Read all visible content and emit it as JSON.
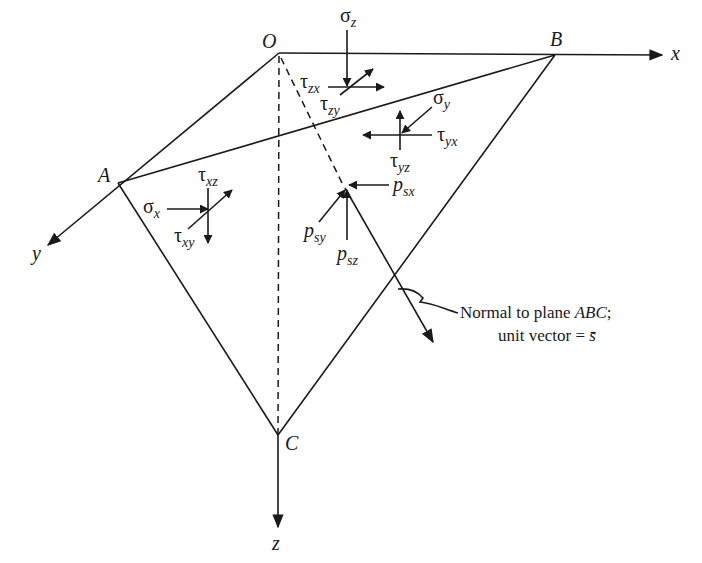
{
  "diagram": {
    "type": "stress tetrahedron",
    "points": {
      "O": {
        "label": "O"
      },
      "A": {
        "label": "A"
      },
      "B": {
        "label": "B"
      },
      "C": {
        "label": "C"
      }
    },
    "axes": {
      "x": "x",
      "y": "y",
      "z": "z"
    },
    "stresses": {
      "sigma_z": {
        "sym": "σ",
        "sub": "z"
      },
      "tau_zx": {
        "sym": "τ",
        "sub": "zx"
      },
      "tau_zy": {
        "sym": "τ",
        "sub": "zy"
      },
      "sigma_y": {
        "sym": "σ",
        "sub": "y"
      },
      "tau_yx": {
        "sym": "τ",
        "sub": "yx"
      },
      "tau_yz": {
        "sym": "τ",
        "sub": "yz"
      },
      "sigma_x": {
        "sym": "σ",
        "sub": "x"
      },
      "tau_xz": {
        "sym": "τ",
        "sub": "xz"
      },
      "tau_xy": {
        "sym": "τ",
        "sub": "xy"
      },
      "p_sx": {
        "sym": "p",
        "sub": "sx"
      },
      "p_sy": {
        "sym": "p",
        "sub": "sy"
      },
      "p_sz": {
        "sym": "p",
        "sub": "sz"
      }
    },
    "annotation": {
      "line1_prefix": "Normal to plane ",
      "line1_italic": "ABC",
      "line1_suffix": ";",
      "line2_prefix": "unit vector = ",
      "line2_symbol": "s̄"
    }
  }
}
